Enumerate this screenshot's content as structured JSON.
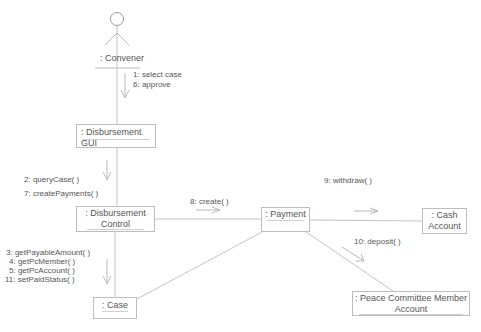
{
  "diagram": {
    "type": "UML collaboration diagram",
    "actor": {
      "name": ": Convener",
      "icon": "stick-figure-actor-icon"
    },
    "objects": [
      {
        "id": "gui",
        "name": ": Disbursement GUI"
      },
      {
        "id": "control",
        "name_line1": ": Disbursement",
        "name_line2": "Control"
      },
      {
        "id": "payment",
        "name": ": Payment"
      },
      {
        "id": "cash",
        "name_line1": ": Cash",
        "name_line2": "Account"
      },
      {
        "id": "pcm",
        "name_line1": ": Peace Committee Member",
        "name_line2": "Account"
      },
      {
        "id": "case",
        "name": ": Case"
      }
    ],
    "messages": {
      "convener_to_gui": [
        "1: select case",
        "6: approve"
      ],
      "gui_to_control": [
        "2: queryCase( )",
        "7: createPayments( )"
      ],
      "control_to_payment": [
        "8: create( )"
      ],
      "payment_to_cash": [
        "9: withdraw( )"
      ],
      "payment_to_pcm": [
        "10: deposit( )"
      ],
      "control_to_case": [
        "3: getPayableAmount( )",
        "4: getPcMember( )",
        "5: getPcAccount( )",
        "11: setPaidStatus( )"
      ]
    },
    "colors": {
      "line": "#c8c8c8",
      "text": "#555555",
      "border": "#bdbdbd"
    }
  }
}
